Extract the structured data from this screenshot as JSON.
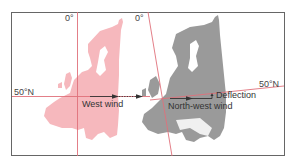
{
  "diagram": {
    "labels": {
      "meridian_left": "0°",
      "meridian_right": "0°",
      "parallel_left": "50°N",
      "parallel_right": "50°N",
      "west_wind": "West wind",
      "northwest_wind": "North-west wind",
      "deflection": "Deflection"
    },
    "colors": {
      "frame": "#666666",
      "grid_line": "#e0707a",
      "map_original": "#f6b8bd",
      "map_rotated": "#9a9a9a",
      "text": "#444444",
      "arrow": "#333333"
    }
  }
}
